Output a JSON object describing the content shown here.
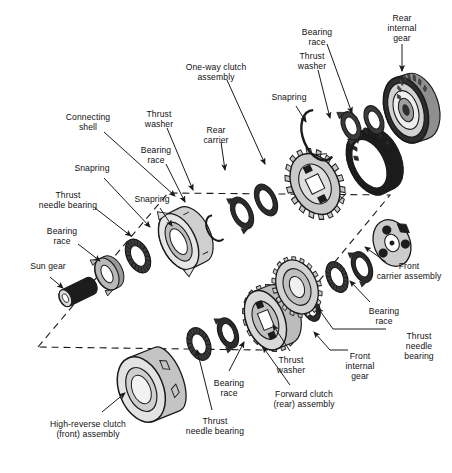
{
  "figure": {
    "type": "exploded-assembly-diagram",
    "background_color": "#ffffff",
    "line_color": "#1a1a1a",
    "fill_light": "#d9d9d9",
    "fill_mid": "#b0b0b0",
    "fill_dark": "#6e6e6e",
    "fill_black": "#1c1c1c",
    "dashed_group_box": {
      "present": true,
      "style": "dashed parallelogram outlining the rear planetary / gear set group",
      "points": "38,347 168,193 390,195 262,350"
    }
  },
  "labels": [
    {
      "id": "connecting-shell",
      "text": "Connecting\nshell",
      "x": 88,
      "y": 118,
      "align": "center"
    },
    {
      "id": "snapring-1",
      "text": "Snapring",
      "x": 92,
      "y": 168,
      "align": "center"
    },
    {
      "id": "thrust-needle-bearing-1",
      "text": "Thrust\nneedle bearing",
      "x": 68,
      "y": 195,
      "align": "center"
    },
    {
      "id": "bearing-race-1",
      "text": "Bearing\nrace",
      "x": 62,
      "y": 231,
      "align": "center"
    },
    {
      "id": "sun-gear",
      "text": "Sun gear",
      "x": 48,
      "y": 266,
      "align": "center"
    },
    {
      "id": "thrust-washer-1",
      "text": "Thrust\nwasher",
      "x": 159,
      "y": 114,
      "align": "center"
    },
    {
      "id": "bearing-race-2",
      "text": "Bearing\nrace",
      "x": 156,
      "y": 150,
      "align": "center"
    },
    {
      "id": "snapring-2",
      "text": "Snapring",
      "x": 152,
      "y": 199,
      "align": "center"
    },
    {
      "id": "rear-carrier",
      "text": "Rear\ncarrier",
      "x": 216,
      "y": 130,
      "align": "center"
    },
    {
      "id": "one-way-clutch-assembly",
      "text": "One-way clutch\nassembly",
      "x": 216,
      "y": 67,
      "align": "center"
    },
    {
      "id": "snapring-3",
      "text": "Snapring",
      "x": 289,
      "y": 97,
      "align": "center"
    },
    {
      "id": "thrust-washer-2",
      "text": "Thrust\nwasher",
      "x": 312,
      "y": 56,
      "align": "center"
    },
    {
      "id": "bearing-race-3",
      "text": "Bearing\nrace",
      "x": 317,
      "y": 32,
      "align": "center"
    },
    {
      "id": "rear-internal-gear",
      "text": "Rear\ninternal\ngear",
      "x": 402,
      "y": 18,
      "align": "center"
    },
    {
      "id": "front-carrier-assembly",
      "text": "Front\ncarrier assembly",
      "x": 409,
      "y": 266,
      "align": "center"
    },
    {
      "id": "bearing-race-4",
      "text": "Bearing\nrace",
      "x": 384,
      "y": 311,
      "align": "center"
    },
    {
      "id": "thrust-needle-bearing-2",
      "text": "Thrust\nneedle\nbearing",
      "x": 420,
      "y": 336,
      "align": "center"
    },
    {
      "id": "front-internal-gear",
      "text": "Front\ninternal\ngear",
      "x": 360,
      "y": 356,
      "align": "center"
    },
    {
      "id": "thrust-washer-3",
      "text": "Thrust\nwasher",
      "x": 291,
      "y": 360,
      "align": "center"
    },
    {
      "id": "bearing-race-5",
      "text": "Bearing\nrace",
      "x": 229,
      "y": 383,
      "align": "center"
    },
    {
      "id": "forward-clutch-assembly",
      "text": "Forward clutch\n(rear) assembly",
      "x": 304,
      "y": 394,
      "align": "center"
    },
    {
      "id": "thrust-needle-bearing-3",
      "text": "Thrust\nneedle bearing",
      "x": 215,
      "y": 421,
      "align": "center"
    },
    {
      "id": "high-reverse-clutch",
      "text": "High-reverse clutch\n(front) assembly",
      "x": 88,
      "y": 424,
      "align": "center"
    }
  ],
  "leader_lines": [
    {
      "from": "connecting-shell",
      "d": "M104,132 L175,196"
    },
    {
      "from": "snapring-1",
      "d": "M104,178 L150,227"
    },
    {
      "from": "thrust-needle-bearing-1",
      "d": "M95,208 L131,236"
    },
    {
      "from": "bearing-race-1",
      "d": "M78,244 L100,261"
    },
    {
      "from": "sun-gear",
      "d": "M50,277 L63,288"
    },
    {
      "from": "thrust-washer-1",
      "d": "M167,128 L193,190"
    },
    {
      "from": "bearing-race-2",
      "d": "M166,164 L185,202"
    },
    {
      "from": "snapring-2",
      "d": "M160,208 L172,226"
    },
    {
      "from": "rear-carrier",
      "d": "M221,142 L225,170"
    },
    {
      "from": "one-way-clutch-assembly",
      "d": "M227,80 L265,164"
    },
    {
      "from": "snapring-3",
      "d": "M296,106 L306,122"
    },
    {
      "from": "thrust-washer-2",
      "d": "M318,70 L330,118"
    },
    {
      "from": "bearing-race-3",
      "d": "M327,44 L352,113"
    },
    {
      "from": "rear-internal-gear",
      "d": "M402,44 L402,71"
    },
    {
      "from": "front-carrier-assembly",
      "d": "M386,262 L365,247"
    },
    {
      "from": "bearing-race-4",
      "d": "M370,302 L350,281"
    },
    {
      "from": "thrust-needle-bearing-2",
      "d": "M386,329 L333,329 L318,308"
    },
    {
      "from": "front-internal-gear",
      "d": "M348,350 L330,350 L314,332"
    },
    {
      "from": "thrust-washer-3",
      "d": "M290,351 L273,325"
    },
    {
      "from": "bearing-race-5",
      "d": "M229,371 L244,342"
    },
    {
      "from": "forward-clutch-assembly",
      "d": "M290,385 L263,347"
    },
    {
      "from": "thrust-needle-bearing-3",
      "d": "M212,410 L197,350"
    },
    {
      "from": "high-reverse-clutch",
      "d": "M102,412 L125,393"
    }
  ],
  "components": [
    {
      "id": "sun-gear-part",
      "kind": "shaft",
      "label_ref": "sun-gear"
    },
    {
      "id": "bearing-race-part-1",
      "kind": "washer"
    },
    {
      "id": "needle-bearing-part-1",
      "kind": "needle-bearing"
    },
    {
      "id": "connecting-shell-part",
      "kind": "shell"
    },
    {
      "id": "snapring-part-1",
      "kind": "ring"
    },
    {
      "id": "washer-part-1",
      "kind": "washer"
    },
    {
      "id": "rear-carrier-part",
      "kind": "carrier"
    },
    {
      "id": "one-way-clutch-part",
      "kind": "ring-gear"
    },
    {
      "id": "snapring-part-3",
      "kind": "open-ring"
    },
    {
      "id": "washer-part-2",
      "kind": "washer"
    },
    {
      "id": "washer-part-3",
      "kind": "washer"
    },
    {
      "id": "rear-internal-gear-part",
      "kind": "internal-gear"
    },
    {
      "id": "high-reverse-clutch-part",
      "kind": "drum"
    },
    {
      "id": "needle-bearing-part-3",
      "kind": "needle-bearing"
    },
    {
      "id": "bearing-race-part-5",
      "kind": "washer"
    },
    {
      "id": "forward-clutch-part",
      "kind": "clutch"
    },
    {
      "id": "thrust-washer-part-3",
      "kind": "washer"
    },
    {
      "id": "front-internal-gear-part",
      "kind": "internal-gear"
    },
    {
      "id": "needle-bearing-part-2",
      "kind": "needle-bearing"
    },
    {
      "id": "bearing-race-part-4",
      "kind": "washer"
    },
    {
      "id": "front-carrier-part",
      "kind": "carrier"
    }
  ]
}
